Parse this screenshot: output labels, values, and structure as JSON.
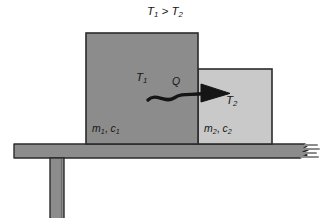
{
  "figure": {
    "kind": "physics-heat-transfer-diagram",
    "width": 329,
    "height": 218,
    "background": "#ffffff"
  },
  "title": {
    "relation_text": "T1 > T2",
    "left_symbol": "T",
    "left_subscript": "1",
    "operator": " > ",
    "right_symbol": "T",
    "right_subscript": "2"
  },
  "blocks": [
    {
      "id": "block-1",
      "name": "hot-block",
      "fill": "#8c8c8c",
      "stroke": "#2b2b2b",
      "x": 86,
      "y": 33,
      "width": 112,
      "height": 111,
      "temperature_symbol": "T",
      "temperature_subscript": "1",
      "properties_mass": "m",
      "properties_mass_subscript": "1",
      "properties_separator": ", ",
      "properties_heat_capacity": "c",
      "properties_heat_capacity_subscript": "1",
      "properties_text": "m1, c1"
    },
    {
      "id": "block-2",
      "name": "cold-block",
      "fill": "#c9c9c9",
      "stroke": "#2b2b2b",
      "x": 198,
      "y": 69,
      "width": 74,
      "height": 75,
      "temperature_symbol": "T",
      "temperature_subscript": "2",
      "properties_mass": "m",
      "properties_mass_subscript": "2",
      "properties_separator": ", ",
      "properties_heat_capacity": "c",
      "properties_heat_capacity_subscript": "2",
      "properties_text": "m2, c2"
    }
  ],
  "heat_flow": {
    "label": "Q",
    "direction": "left-to-right",
    "color": "#151515",
    "description": "wavy-arrow-from-hot-block-to-cold-block"
  },
  "table": {
    "name": "support-table",
    "fill": "#8c8c8c",
    "stroke": "#2b2b2b",
    "top_x": 14,
    "top_y": 144,
    "top_width": 296,
    "top_height": 14,
    "leg_x": 50,
    "leg_y": 158,
    "leg_width": 14,
    "leg_height": 60,
    "right_edge": "torn"
  },
  "colors": {
    "hot_block": "#8c8c8c",
    "cold_block": "#c9c9c9",
    "table": "#8c8c8c",
    "outline": "#2b2b2b",
    "text": "#161616",
    "background": "#ffffff"
  }
}
